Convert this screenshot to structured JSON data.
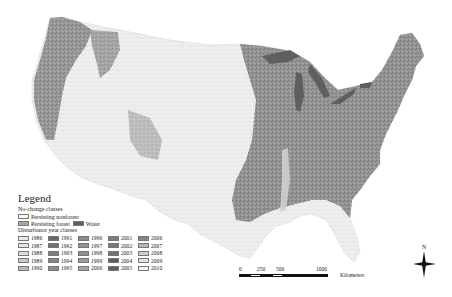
{
  "legend": {
    "title": "Legend",
    "nochange_header": "No-change classes",
    "nochange": [
      {
        "label": "Persisting nonforest",
        "color": "#f6f6f6"
      },
      {
        "label": "Persisting forest",
        "color": "#a7a7a7"
      },
      {
        "label": "Water",
        "color": "#5f5f5f"
      }
    ],
    "disturbance_header": "Disturbance year classes",
    "years": [
      {
        "year": "1986",
        "color": "#e8e8e8"
      },
      {
        "year": "1987",
        "color": "#e4e4e4"
      },
      {
        "year": "1988",
        "color": "#dcdcdc"
      },
      {
        "year": "1989",
        "color": "#c8c8c8"
      },
      {
        "year": "1990",
        "color": "#b9b9b9"
      },
      {
        "year": "1991",
        "color": "#6a6a6a"
      },
      {
        "year": "1992",
        "color": "#727272"
      },
      {
        "year": "1993",
        "color": "#7e7e7e"
      },
      {
        "year": "1994",
        "color": "#868686"
      },
      {
        "year": "1995",
        "color": "#8e8e8e"
      },
      {
        "year": "1996",
        "color": "#8a8a8a"
      },
      {
        "year": "1997",
        "color": "#959595"
      },
      {
        "year": "1998",
        "color": "#8f8f8f"
      },
      {
        "year": "1999",
        "color": "#9a9a9a"
      },
      {
        "year": "2000",
        "color": "#a2a2a2"
      },
      {
        "year": "2001",
        "color": "#7c7c7c"
      },
      {
        "year": "2002",
        "color": "#777777"
      },
      {
        "year": "2003",
        "color": "#707070"
      },
      {
        "year": "2004",
        "color": "#5e5e5e"
      },
      {
        "year": "2005",
        "color": "#626262"
      },
      {
        "year": "2006",
        "color": "#858585"
      },
      {
        "year": "2007",
        "color": "#b4b4b4"
      },
      {
        "year": "2008",
        "color": "#cfcfcf"
      },
      {
        "year": "2009",
        "color": "#e2e2e2"
      },
      {
        "year": "2010",
        "color": "#f4f4f4"
      }
    ]
  },
  "scale": {
    "ticks": [
      "0",
      "250",
      "500",
      "1000"
    ],
    "unit": "Kilometers"
  },
  "north_label": "N",
  "map": {
    "region": "Conterminous United States",
    "nonforest_color": "#f4f4f4",
    "forest_color": "#9a9a9a",
    "water_color": "#5f5f5f"
  }
}
